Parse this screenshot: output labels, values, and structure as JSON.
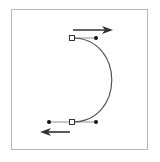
{
  "diagram": {
    "type": "bezier-path-illustration",
    "frame": {
      "x": 11,
      "y": 9,
      "width": 137,
      "height": 141,
      "stroke": "#b8b8b8"
    },
    "curve": {
      "stroke": "#555555",
      "start_anchor": [
        72,
        38
      ],
      "start_handle": [
        96,
        38
      ],
      "end_anchor": [
        72,
        122
      ],
      "end_handle": [
        96,
        122
      ],
      "path": "M72,38 C125,38 125,122 72,122"
    },
    "anchors": [
      {
        "name": "top-anchor",
        "x": 72,
        "y": 38,
        "style": "hollow-square"
      },
      {
        "name": "bottom-anchor",
        "x": 72,
        "y": 122,
        "style": "hollow-square"
      }
    ],
    "handles": [
      {
        "name": "top-handle-right",
        "x": 96,
        "y": 38,
        "anchor": [
          72,
          38
        ]
      },
      {
        "name": "bottom-handle-left",
        "x": 49,
        "y": 122,
        "anchor": [
          72,
          122
        ]
      },
      {
        "name": "bottom-handle-right",
        "x": 96,
        "y": 122,
        "anchor": [
          72,
          122
        ]
      }
    ],
    "arrows": [
      {
        "name": "direction-arrow-right",
        "x1": 73,
        "y1": 30,
        "x2": 113,
        "y2": 30,
        "direction": "right"
      },
      {
        "name": "direction-arrow-left",
        "x1": 70,
        "y1": 132,
        "x2": 40,
        "y2": 132,
        "direction": "left"
      }
    ],
    "colors": {
      "ink": "#333333",
      "curve": "#555555",
      "handle_line": "#777777"
    }
  }
}
